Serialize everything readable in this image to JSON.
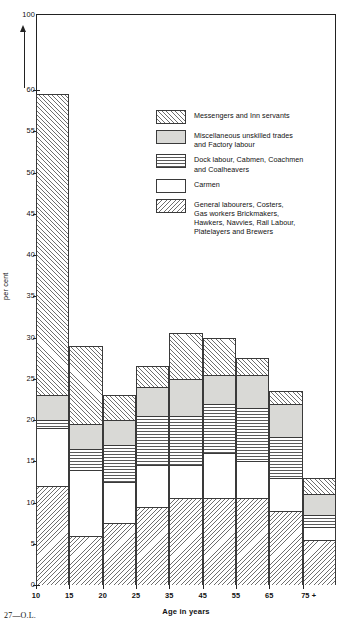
{
  "axes": {
    "y_title": "per cent",
    "y_ticks": [
      0,
      5,
      10,
      15,
      20,
      25,
      30,
      35,
      40,
      45,
      50,
      55,
      60
    ],
    "y_top_label": "100",
    "x_title": "Age in years",
    "x_ticks": [
      "10",
      "15",
      "20",
      "25",
      "35",
      "45",
      "55",
      "65",
      "75 +"
    ]
  },
  "legend": {
    "items": [
      {
        "key": "messengers",
        "pattern": "diagonal-hatch-up",
        "lines": [
          "Messengers and Inn servants"
        ]
      },
      {
        "key": "miscellaneous",
        "pattern": "solid-grey",
        "lines": [
          "Miscellaneous unskilled trades",
          "and  Factory labour"
        ]
      },
      {
        "key": "dock",
        "pattern": "horizontal-lines",
        "lines": [
          "Dock labour, Cabmen, Coachmen",
          "and  Coalheavers"
        ]
      },
      {
        "key": "carmen",
        "pattern": "blank-white",
        "lines": [
          "Carmen"
        ]
      },
      {
        "key": "general",
        "pattern": "diagonal-hatch-down",
        "lines": [
          "General labourers, Costers,",
          "Gas workers Brickmakers,",
          "Hawkers, Navvies, Rail Labour,",
          "Platelayers and Brewers"
        ]
      }
    ]
  },
  "footer": {
    "note": "27—O.L."
  },
  "chart_data": {
    "type": "bar",
    "title": "",
    "xlabel": "Age in years",
    "ylabel": "per cent",
    "ylim": [
      0,
      60
    ],
    "grid": false,
    "stacked": true,
    "legend_position": "inside-top-right",
    "categories": [
      "10",
      "15",
      "20",
      "25",
      "35",
      "45",
      "55",
      "65",
      "75 +"
    ],
    "series": [
      {
        "name": "General labourers, Costers, Gas workers Brickmakers, Hawkers, Navvies, Rail Labour, Platelayers and Brewers",
        "values": [
          12.0,
          6.0,
          7.5,
          9.5,
          10.5,
          10.5,
          10.5,
          9.0,
          5.5
        ]
      },
      {
        "name": "Carmen",
        "values": [
          7.0,
          8.0,
          5.0,
          5.0,
          4.0,
          5.5,
          4.5,
          4.0,
          1.5
        ]
      },
      {
        "name": "Dock labour, Cabmen, Coachmen and Coalheavers",
        "values": [
          1.0,
          2.5,
          4.5,
          6.0,
          6.0,
          6.0,
          6.5,
          5.0,
          1.5
        ]
      },
      {
        "name": "Miscellaneous unskilled trades and Factory labour",
        "values": [
          3.0,
          3.0,
          3.0,
          3.5,
          4.5,
          3.5,
          4.0,
          4.0,
          2.5
        ]
      },
      {
        "name": "Messengers and Inn servants",
        "values": [
          36.5,
          9.5,
          3.0,
          2.5,
          5.5,
          4.5,
          2.0,
          1.5,
          2.0
        ]
      }
    ],
    "totals": [
      59.5,
      29.0,
      23.0,
      26.5,
      30.5,
      30.0,
      27.5,
      23.5,
      13.0
    ]
  }
}
